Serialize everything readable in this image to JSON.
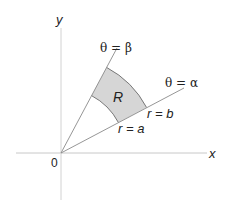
{
  "diagram": {
    "type": "polar-region",
    "axes": {
      "x_label": "x",
      "y_label": "y",
      "origin_label": "0"
    },
    "rays": [
      {
        "label": "θ = β",
        "angle_name": "beta"
      },
      {
        "label": "θ = α",
        "angle_name": "alpha"
      }
    ],
    "arcs": [
      {
        "label": "r = a",
        "radius_name": "a"
      },
      {
        "label": "r = b",
        "radius_name": "b"
      }
    ],
    "region": {
      "label": "R",
      "fill": "#d6d6d6"
    },
    "colors": {
      "axis": "#c8c8c8",
      "ray": "#8a8a8a",
      "arc": "#6a6a6a",
      "text": "#222222"
    }
  }
}
